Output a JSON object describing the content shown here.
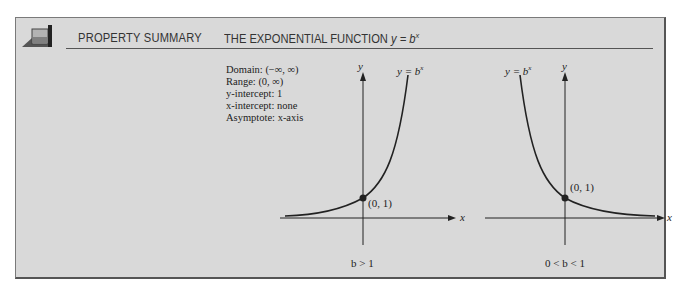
{
  "header": {
    "section_label": "PROPERTY SUMMARY",
    "title_prefix": "THE EXPONENTIAL FUNCTION ",
    "title_formula": "y = b",
    "title_exponent": "x"
  },
  "properties": [
    {
      "label": "Domain: ",
      "value": "(−∞, ∞)"
    },
    {
      "label": "Range: ",
      "value": "(0, ∞)"
    },
    {
      "label": "y-intercept: ",
      "value": "1"
    },
    {
      "label": "x-intercept: ",
      "value": "none"
    },
    {
      "label": "Asymptote: ",
      "value": "x-axis"
    }
  ],
  "graphs": [
    {
      "caption": "b > 1",
      "curve_label": "y = b",
      "curve_exp": "x",
      "point_label": "(0, 1)",
      "x_axis_label": "x",
      "y_axis_label": "y"
    },
    {
      "caption": "0 < b < 1",
      "curve_label": "y = b",
      "curve_exp": "x",
      "point_label": "(0, 1)",
      "x_axis_label": "x",
      "y_axis_label": "y"
    }
  ],
  "colors": {
    "panel_bg": "#d9d9d9",
    "ink": "#222222",
    "icon_fill": "#a8a8a8",
    "icon_dark": "#444444"
  }
}
